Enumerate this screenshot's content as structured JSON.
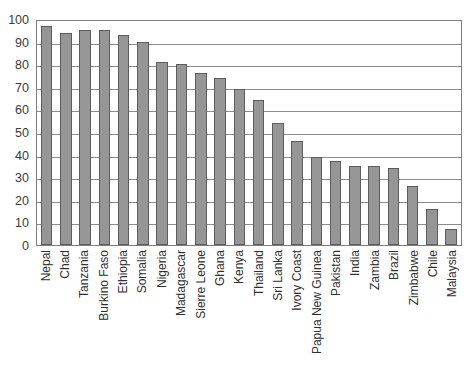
{
  "chart_data": {
    "type": "bar",
    "title": "",
    "xlabel": "",
    "ylabel": "",
    "ylim": [
      0,
      100
    ],
    "ytick_step": 10,
    "yticks": [
      100,
      90,
      80,
      70,
      60,
      50,
      40,
      30,
      20,
      10,
      0
    ],
    "grid": true,
    "legend": "none",
    "bar_color": "#969696",
    "bar_border_color": "#5d5d5d",
    "axis_color": "#7d7d7d",
    "categories": [
      "Nepal",
      "Chad",
      "Tanzania",
      "Burkino Faso",
      "Ethiopia",
      "Somalia",
      "Nigeria",
      "Madagascar",
      "Sierre Leone",
      "Ghana",
      "Kenya",
      "Thailand",
      "Sri Lanka",
      "Ivory Coast",
      "Papua New Guinea",
      "Pakistan",
      "India",
      "Zambia",
      "Brazil",
      "Zimbabwe",
      "Chile",
      "Malaysia"
    ],
    "values": [
      97,
      94,
      95,
      95,
      93,
      90,
      81,
      80,
      76,
      74,
      69,
      64,
      54,
      46,
      39,
      37,
      35,
      35,
      34,
      26,
      16,
      7
    ]
  }
}
